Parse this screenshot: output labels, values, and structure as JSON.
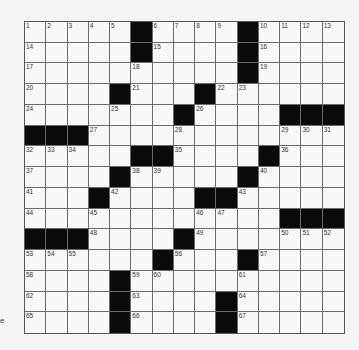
{
  "puzzle": {
    "rows": 15,
    "cols": 15,
    "layout": [
      "1 2 3 4 5 # 6 7 8 9 # 10 11 12 13",
      "14 . . . . # 15 . . . # 16 . . .",
      "17 . . . . 18 . . . . # 19 . . .",
      "20 . . . # 21 . . # 22 23 . . . .",
      "24 . . . 25 . . # 26 . . . # # #",
      "# # # 27 . . . 28 . . . . 29 30 31",
      "32 33 34 . . # # 35 . . . # 36 . .",
      "37 . . . # 38 39 . . . # 40 . . .",
      "41 . . # 42 . . . # # 43 . . . .",
      "44 . . 45 . . . . 46 47 . . # # #",
      "# # # 48 . . . # 49 . . . 50 51 52",
      "53 54 55 . . . # 56 . . # 57 . . .",
      "58 . . . # 59 60 . . . 61 . . . .",
      "62 . . . # 63 . . . # 64 . . . .",
      "65 . . . # 66 . . . # 67 . . . ."
    ]
  },
  "side_mark": "e"
}
